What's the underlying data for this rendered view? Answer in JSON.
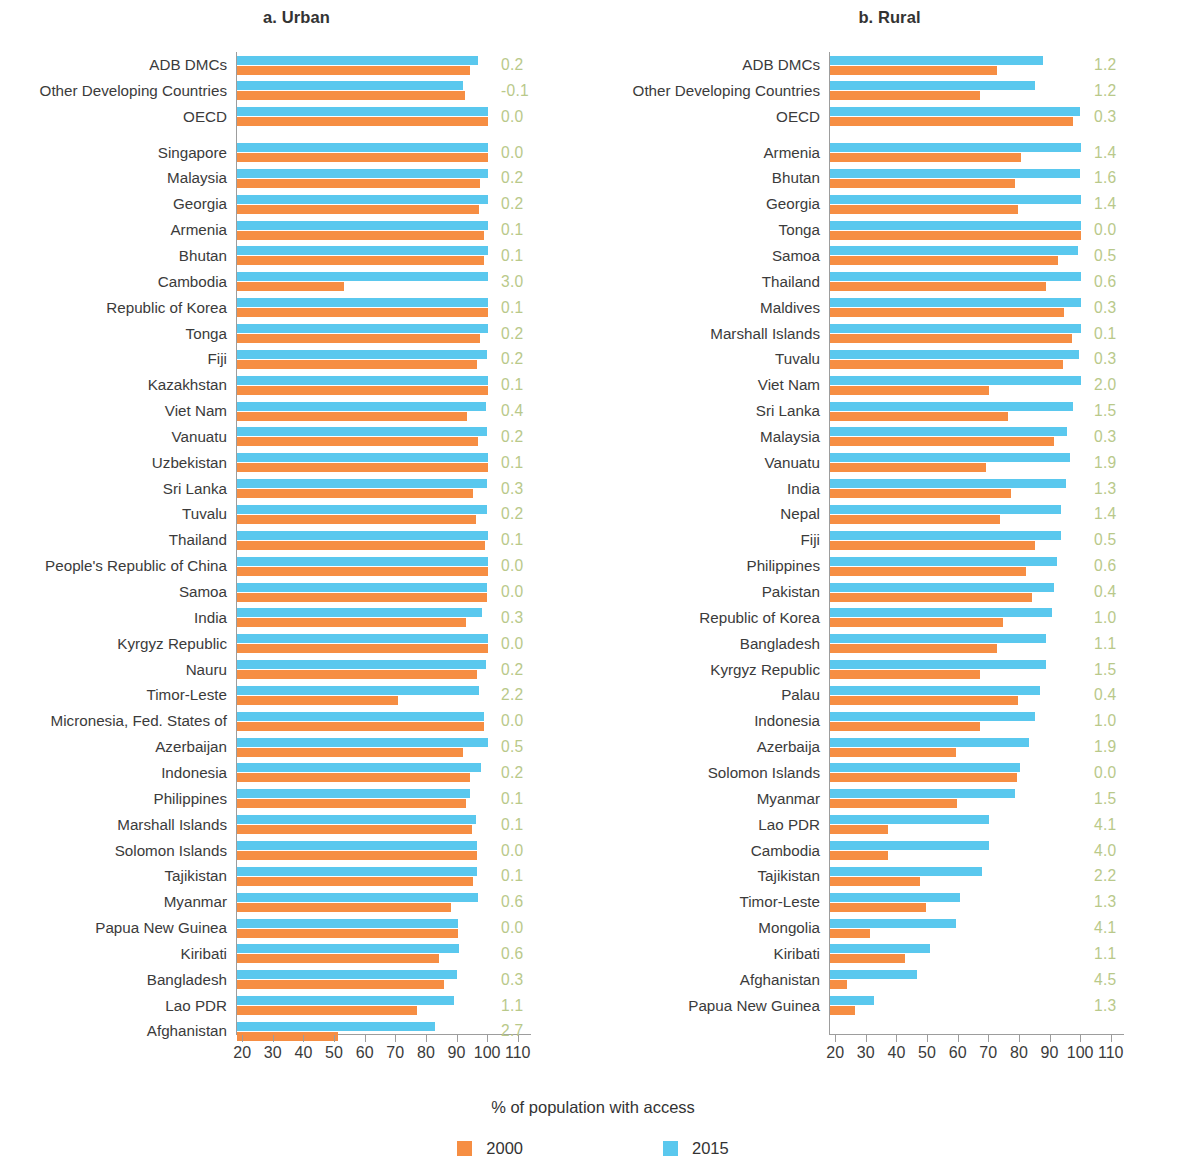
{
  "figure": {
    "legend_title": "% of population with access",
    "legend": [
      {
        "label": "2000",
        "color": "#f68e43"
      },
      {
        "label": "2015",
        "color": "#5ac8ee"
      }
    ]
  },
  "chart_data": [
    {
      "type": "bar",
      "title": "a. Urban",
      "orientation": "horizontal",
      "xlabel": "",
      "ylabel": "",
      "xlim": [
        18,
        114
      ],
      "xticks": [
        20,
        30,
        40,
        50,
        60,
        70,
        80,
        90,
        100,
        110
      ],
      "grid": false,
      "legend_position": "bottom-center",
      "colors": {
        "2000": "#f68e43",
        "2015": "#5ac8ee",
        "value_label": "#b9c98a"
      },
      "value_label_header": "",
      "categories": [
        "ADB DMCs",
        "Other Developing Countries",
        "OECD",
        "Singapore",
        "Malaysia",
        "Georgia",
        "Armenia",
        "Bhutan",
        "Cambodia",
        "Republic of Korea",
        "Tonga",
        "Fiji",
        "Kazakhstan",
        "Viet Nam",
        "Vanuatu",
        "Uzbekistan",
        "Sri Lanka",
        "Tuvalu",
        "Thailand",
        "People's Republic of China",
        "Samoa",
        "India",
        "Kyrgyz Republic",
        "Nauru",
        "Timor-Leste",
        "Micronesia, Fed. States of",
        "Azerbaijan",
        "Indonesia",
        "Philippines",
        "Marshall Islands",
        "Solomon Islands",
        "Tajikistan",
        "Myanmar",
        "Papua New Guinea",
        "Kiribati",
        "Bangladesh",
        "Lao PDR",
        "Afghanistan"
      ],
      "group_breaks_after": [
        2
      ],
      "series": [
        {
          "name": "2015",
          "values": [
            96.7,
            91.9,
            100.0,
            100.0,
            100.0,
            100.0,
            100.0,
            100.0,
            100.0,
            100.0,
            100.0,
            99.6,
            100.0,
            99.2,
            99.7,
            100.0,
            99.6,
            99.6,
            99.9,
            100.0,
            99.7,
            98.0,
            100.0,
            99.3,
            97.1,
            98.6,
            99.8,
            97.6,
            94.1,
            96.0,
            96.5,
            96.5,
            96.8,
            90.1,
            90.5,
            89.8,
            88.8,
            82.5
          ]
        },
        {
          "name": "2000",
          "values": [
            94.0,
            92.5,
            100.0,
            100.0,
            97.3,
            97.0,
            98.8,
            98.8,
            53.0,
            100.0,
            97.5,
            96.4,
            100.0,
            93.2,
            96.8,
            100.0,
            95.0,
            96.0,
            98.9,
            100.0,
            99.7,
            92.8,
            100.0,
            96.3,
            70.5,
            98.6,
            91.8,
            94.0,
            92.8,
            94.8,
            96.5,
            95.2,
            88.0,
            90.1,
            84.0,
            85.6,
            76.8,
            51.0
          ]
        }
      ],
      "value_labels": [
        "0.2",
        "-0.1",
        "0.0",
        "0.0",
        "0.2",
        "0.2",
        "0.1",
        "0.1",
        "3.0",
        "0.1",
        "0.2",
        "0.2",
        "0.1",
        "0.4",
        "0.2",
        "0.1",
        "0.3",
        "0.2",
        "0.1",
        "0.0",
        "0.0",
        "0.3",
        "0.0",
        "0.2",
        "2.2",
        "0.0",
        "0.5",
        "0.2",
        "0.1",
        "0.1",
        "0.0",
        "0.1",
        "0.6",
        "0.0",
        "0.6",
        "0.3",
        "1.1",
        "2.7"
      ]
    },
    {
      "type": "bar",
      "title": "b. Rural",
      "orientation": "horizontal",
      "xlabel": "",
      "ylabel": "",
      "xlim": [
        18,
        114
      ],
      "xticks": [
        20,
        30,
        40,
        50,
        60,
        70,
        80,
        90,
        100,
        110
      ],
      "grid": false,
      "legend_position": "bottom-center",
      "colors": {
        "2000": "#f68e43",
        "2015": "#5ac8ee",
        "value_label": "#b9c98a"
      },
      "categories": [
        "ADB DMCs",
        "Other Developing Countries",
        "OECD",
        "Armenia",
        "Bhutan",
        "Georgia",
        "Tonga",
        "Samoa",
        "Thailand",
        "Maldives",
        "Marshall Islands",
        "Tuvalu",
        "Viet Nam",
        "Sri Lanka",
        "Malaysia",
        "Vanuatu",
        "India",
        "Nepal",
        "Fiji",
        "Philippines",
        "Pakistan",
        "Republic of Korea",
        "Bangladesh",
        "Kyrgyz Republic",
        "Palau",
        "Indonesia",
        "Azerbaija",
        "Solomon Islands",
        "Myanmar",
        "Lao PDR",
        "Cambodia",
        "Tajikistan",
        "Timor-Leste",
        "Mongolia",
        "Kiribati",
        "Afghanistan",
        "Papua New Guinea"
      ],
      "group_breaks_after": [
        2
      ],
      "series": [
        {
          "name": "2015",
          "values": [
            87.5,
            84.8,
            99.5,
            100.0,
            99.5,
            100.0,
            100.0,
            99.0,
            100.0,
            100.0,
            100.0,
            99.3,
            100.0,
            97.5,
            95.5,
            96.5,
            95.0,
            93.5,
            93.5,
            92.0,
            91.2,
            90.5,
            88.5,
            88.5,
            86.5,
            84.8,
            83.0,
            80.0,
            78.5,
            70.0,
            70.0,
            67.5,
            60.5,
            59.0,
            50.5,
            46.5,
            32.5
          ]
        },
        {
          "name": "2000",
          "values": [
            72.5,
            67.0,
            97.5,
            80.5,
            78.5,
            79.5,
            100.0,
            92.5,
            88.5,
            94.5,
            97.0,
            94.0,
            70.0,
            76.0,
            91.0,
            69.0,
            77.0,
            73.5,
            85.0,
            82.0,
            84.0,
            74.5,
            72.5,
            67.0,
            79.5,
            67.0,
            59.0,
            79.0,
            59.5,
            37.0,
            37.0,
            47.5,
            49.5,
            31.0,
            42.5,
            23.5,
            26.0
          ]
        }
      ],
      "value_labels": [
        "1.2",
        "1.2",
        "0.3",
        "1.4",
        "1.6",
        "1.4",
        "0.0",
        "0.5",
        "0.6",
        "0.3",
        "0.1",
        "0.3",
        "2.0",
        "1.5",
        "0.3",
        "1.9",
        "1.3",
        "1.4",
        "0.5",
        "0.6",
        "0.4",
        "1.0",
        "1.1",
        "1.5",
        "0.4",
        "1.0",
        "1.9",
        "0.0",
        "1.5",
        "4.1",
        "4.0",
        "2.2",
        "1.3",
        "4.1",
        "1.1",
        "4.5",
        "1.3"
      ]
    }
  ]
}
